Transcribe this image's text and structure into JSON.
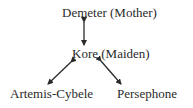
{
  "diagram": {
    "nodes": [
      {
        "id": "demeter",
        "label": "Demeter (Mother)"
      },
      {
        "id": "kore",
        "label": "Kore (Maiden)"
      },
      {
        "id": "artemis",
        "label": "Artemis-Cybele"
      },
      {
        "id": "persephone",
        "label": "Persephone"
      }
    ],
    "edges": [
      {
        "from": "demeter",
        "to": "kore",
        "type": "bidirectional"
      },
      {
        "from": "kore",
        "to": "artemis",
        "type": "bidirectional"
      },
      {
        "from": "kore",
        "to": "persephone",
        "type": "bidirectional"
      }
    ],
    "colors": {
      "ink": "#2a2a2a",
      "background": "#ffffff"
    }
  }
}
